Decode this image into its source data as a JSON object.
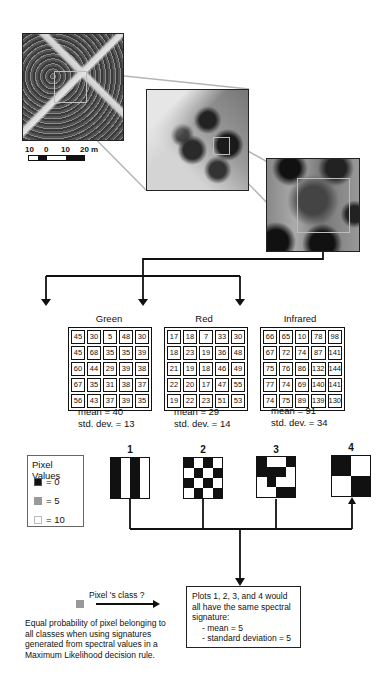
{
  "images": {
    "aerial": {
      "description": "aerial photo of forest with crossing roads"
    },
    "zoom_1": {
      "description": "enlarged section of forest canopy"
    },
    "zoom_2": {
      "description": "further enlarged pixel-level section"
    }
  },
  "scale_bar": {
    "labels": [
      "10",
      "0",
      "10",
      "20 m"
    ]
  },
  "bands": [
    {
      "name": "Green",
      "grid": [
        [
          45,
          30,
          5,
          48,
          30
        ],
        [
          45,
          68,
          35,
          35,
          39
        ],
        [
          60,
          44,
          29,
          39,
          38
        ],
        [
          67,
          35,
          31,
          38,
          37
        ],
        [
          56,
          43,
          37,
          39,
          35
        ]
      ],
      "mean_label": "mean = 40",
      "std_label": "std. dev. = 13"
    },
    {
      "name": "Red",
      "grid": [
        [
          17,
          18,
          7,
          33,
          30
        ],
        [
          18,
          23,
          19,
          36,
          48
        ],
        [
          21,
          19,
          18,
          46,
          49
        ],
        [
          22,
          20,
          17,
          47,
          55
        ],
        [
          19,
          22,
          23,
          51,
          53
        ]
      ],
      "mean_label": "mean = 29",
      "std_label": "std. dev. = 14"
    },
    {
      "name": "Infrared",
      "grid": [
        [
          66,
          65,
          10,
          78,
          98
        ],
        [
          67,
          72,
          74,
          87,
          141
        ],
        [
          75,
          76,
          86,
          132,
          144
        ],
        [
          77,
          74,
          69,
          140,
          141
        ],
        [
          74,
          75,
          89,
          139,
          130
        ]
      ],
      "mean_label": "mean = 91",
      "std_label": "std. dev. = 34"
    }
  ],
  "legend": {
    "title": "Pixel Values",
    "items": [
      {
        "label": "= 0",
        "color": "#111111"
      },
      {
        "label": "= 5",
        "color": "#999999"
      },
      {
        "label": "= 10",
        "color": "#ffffff"
      }
    ]
  },
  "plots": [
    {
      "number": "1",
      "cols": 4,
      "rows": 1,
      "cells": [
        "b",
        "w",
        "b",
        "w"
      ]
    },
    {
      "number": "2",
      "cols": 4,
      "rows": 4,
      "cells": [
        "b",
        "w",
        "b",
        "w",
        "w",
        "b",
        "w",
        "b",
        "b",
        "w",
        "b",
        "w",
        "w",
        "b",
        "w",
        "b"
      ]
    },
    {
      "number": "3",
      "cols": 4,
      "rows": 4,
      "cells": [
        "b",
        "w",
        "w",
        "b",
        "b",
        "b",
        "b",
        "w",
        "w",
        "b",
        "w",
        "w",
        "w",
        "w",
        "b",
        "b"
      ]
    },
    {
      "number": "4",
      "cols": 2,
      "rows": 2,
      "cells": [
        "b",
        "w",
        "w",
        "b"
      ]
    }
  ],
  "pixel_question": {
    "label": "Pixel 's class ?",
    "pixel_color": "#999999",
    "caption": "Equal probability of pixel belonging to all classes when using signatures generated from spectral values in a Maximum Likelihood decision rule."
  },
  "result_box": {
    "line1": "Plots 1, 2, 3, and 4 would all have the same spectral signature:",
    "line2": "- mean = 5",
    "line3": "- standard deviation = 5"
  }
}
